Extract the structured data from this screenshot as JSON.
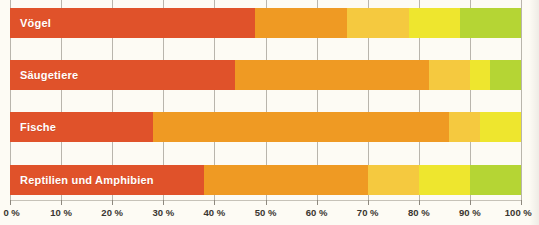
{
  "chart_data": {
    "type": "bar",
    "orientation": "horizontal",
    "stacked": true,
    "title": "",
    "xlabel": "",
    "ylabel": "",
    "xlim": [
      0,
      100
    ],
    "grid": true,
    "legend": "none",
    "categories": [
      "Vögel",
      "Säugetiere",
      "Fische",
      "Reptilien und Amphibien"
    ],
    "tick_labels": [
      "0 %",
      "10 %",
      "20 %",
      "30 %",
      "40 %",
      "50 %",
      "60 %",
      "70 %",
      "80 %",
      "90 %",
      "100 %"
    ],
    "tick_values": [
      0,
      10,
      20,
      30,
      40,
      50,
      60,
      70,
      80,
      90,
      100
    ],
    "palette": {
      "red_orange": "#E0522A",
      "orange": "#EF9A23",
      "amber": "#F5C93F",
      "yellow": "#EEE62E",
      "green_yellow": "#B5D534",
      "gridline": "#b9b5ac",
      "background": "#fdfbf4",
      "label_text": "#ffffff",
      "axis_text": "#3a3630"
    },
    "series": [
      {
        "name": "red_orange",
        "color": "#E0522A",
        "values": [
          48,
          44,
          28,
          38
        ]
      },
      {
        "name": "orange",
        "color": "#EF9A23",
        "values": [
          18,
          38,
          58,
          32
        ]
      },
      {
        "name": "amber",
        "color": "#F5C93F",
        "values": [
          12,
          8,
          6,
          10
        ]
      },
      {
        "name": "yellow",
        "color": "#EEE62E",
        "values": [
          10,
          4,
          8,
          10
        ]
      },
      {
        "name": "green_yellow",
        "color": "#B5D534",
        "values": [
          12,
          6,
          0,
          10
        ]
      }
    ],
    "bars": [
      {
        "label": "Vögel",
        "segments": [
          {
            "color": "#E0522A",
            "start": 0,
            "end": 48
          },
          {
            "color": "#EF9A23",
            "start": 48,
            "end": 66
          },
          {
            "color": "#F5C93F",
            "start": 66,
            "end": 78
          },
          {
            "color": "#EEE62E",
            "start": 78,
            "end": 88
          },
          {
            "color": "#B5D534",
            "start": 88,
            "end": 100
          }
        ]
      },
      {
        "label": "Säugetiere",
        "segments": [
          {
            "color": "#E0522A",
            "start": 0,
            "end": 44
          },
          {
            "color": "#EF9A23",
            "start": 44,
            "end": 82
          },
          {
            "color": "#F5C93F",
            "start": 82,
            "end": 90
          },
          {
            "color": "#EEE62E",
            "start": 90,
            "end": 94
          },
          {
            "color": "#B5D534",
            "start": 94,
            "end": 100
          }
        ]
      },
      {
        "label": "Fische",
        "segments": [
          {
            "color": "#E0522A",
            "start": 0,
            "end": 28
          },
          {
            "color": "#EF9A23",
            "start": 28,
            "end": 86
          },
          {
            "color": "#F5C93F",
            "start": 86,
            "end": 92
          },
          {
            "color": "#EEE62E",
            "start": 92,
            "end": 100
          }
        ]
      },
      {
        "label": "Reptilien und Amphibien",
        "segments": [
          {
            "color": "#E0522A",
            "start": 0,
            "end": 38
          },
          {
            "color": "#EF9A23",
            "start": 38,
            "end": 70
          },
          {
            "color": "#F5C93F",
            "start": 70,
            "end": 80
          },
          {
            "color": "#EEE62E",
            "start": 80,
            "end": 90
          },
          {
            "color": "#B5D534",
            "start": 90,
            "end": 100
          }
        ]
      }
    ],
    "bar_tops": [
      8,
      60,
      112,
      165
    ],
    "bar_height": 30
  }
}
